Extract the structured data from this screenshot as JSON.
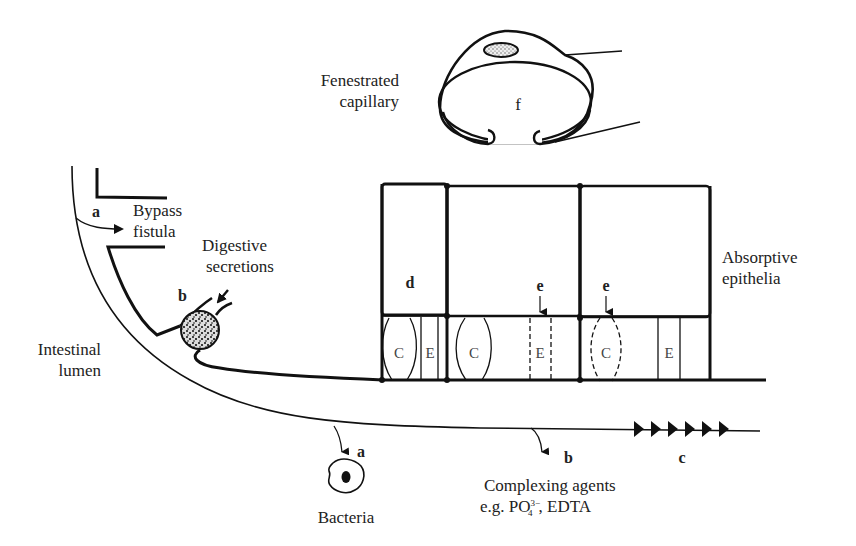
{
  "labels": {
    "fenestrated_line1": "Fenestrated",
    "fenestrated_line2": "capillary",
    "capillary_lumen": "f",
    "bypass_line1": "Bypass",
    "bypass_line2": "fistula",
    "digestive_line1": "Digestive",
    "digestive_line2": "secretions",
    "intestinal_line1": "Intestinal",
    "intestinal_line2": "lumen",
    "absorptive_line1": "Absorptive",
    "absorptive_line2": "epithelia",
    "bacteria": "Bacteria",
    "complexing_line1": "Complexing agents",
    "complexing_line2_prefix": "e.g. PO",
    "complexing_sub": "4",
    "complexing_sup": "3−",
    "complexing_line2_suffix": ", EDTA"
  },
  "markers": {
    "a_bypass": "a",
    "b_secretion": "b",
    "d_cell": "d",
    "e_junction1": "e",
    "e_junction2": "e",
    "a_bacteria": "a",
    "b_complexing": "b",
    "c_transit": "c"
  },
  "junction_labels": {
    "cell1_c": "C",
    "cell1_e": "E",
    "cell2_c": "C",
    "cell2_e": "E",
    "cell3_c": "C",
    "cell3_e": "E"
  },
  "colors": {
    "ink": "#111111",
    "paper": "#ffffff"
  }
}
